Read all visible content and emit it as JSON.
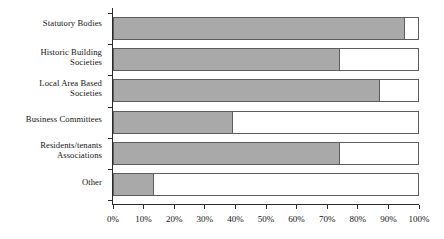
{
  "chart_data": {
    "type": "bar",
    "orientation": "horizontal",
    "title": "",
    "subtitle": "",
    "xlabel": "",
    "ylabel": "",
    "xlim": [
      0,
      100
    ],
    "grid": false,
    "legend": null,
    "units": "percent",
    "categories": [
      "Statutory Bodies",
      "Historic Building\nSocieties",
      "Local Area Based\nSocieties",
      "Business Committees",
      "Residents/tenants\nAssociations",
      "Other"
    ],
    "category_lines": [
      [
        "Statutory Bodies"
      ],
      [
        "Historic Building",
        "Societies"
      ],
      [
        "Local Area Based",
        "Societies"
      ],
      [
        "Business Committees"
      ],
      [
        "Residents/tenants",
        "Associations"
      ],
      [
        "Other"
      ]
    ],
    "values": [
      95,
      74,
      87,
      39,
      74,
      13
    ],
    "tick_labels": [
      "0%",
      "10%",
      "20%",
      "30%",
      "40%",
      "50%",
      "60%",
      "70%",
      "80%",
      "90%",
      "100%"
    ],
    "tick_values": [
      0,
      10,
      20,
      30,
      40,
      50,
      60,
      70,
      80,
      90,
      100
    ],
    "colors": {
      "bar_fill": "#a9a9a9",
      "bar_track": "#ffffff",
      "bar_outline": "#5d5d5d",
      "axis": "#2a2a2a",
      "text": "#141414",
      "background": "#ffffff"
    }
  }
}
